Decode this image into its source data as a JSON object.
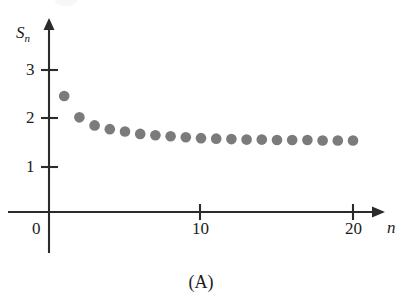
{
  "figure": {
    "caption": "(A)",
    "y_axis_label": "S",
    "y_axis_label_sub": "n",
    "x_axis_label": "n"
  },
  "chart_data": {
    "type": "scatter",
    "title": "",
    "subtitle": "",
    "caption": "(A)",
    "xlabel": "n",
    "ylabel": "S_n",
    "x": [
      1,
      2,
      3,
      4,
      5,
      6,
      7,
      8,
      9,
      10,
      11,
      12,
      13,
      14,
      15,
      16,
      17,
      18,
      19,
      20
    ],
    "values": [
      2.45,
      2.0,
      1.83,
      1.75,
      1.7,
      1.65,
      1.62,
      1.6,
      1.58,
      1.56,
      1.55,
      1.54,
      1.53,
      1.53,
      1.52,
      1.52,
      1.52,
      1.51,
      1.51,
      1.51
    ],
    "series": [
      {
        "name": "S_n",
        "values": [
          2.45,
          2.0,
          1.83,
          1.75,
          1.7,
          1.65,
          1.62,
          1.6,
          1.58,
          1.56,
          1.55,
          1.54,
          1.53,
          1.53,
          1.52,
          1.52,
          1.52,
          1.51,
          1.51,
          1.51
        ],
        "color": "#7b7b7b",
        "marker": "circle"
      }
    ],
    "xlim": [
      0,
      21.5
    ],
    "ylim": [
      0,
      3.4
    ],
    "xticks": [
      0,
      10,
      20
    ],
    "xticklabels": [
      "0",
      "10",
      "20"
    ],
    "yticks": [
      1,
      2,
      3
    ],
    "yticklabels": [
      "1",
      "2",
      "3"
    ],
    "grid": false,
    "legend": false,
    "legend_position": "none",
    "axis_style": "arrow-tipped",
    "marker_color": "#7b7b7b",
    "axis_color": "#2b2b2b"
  }
}
